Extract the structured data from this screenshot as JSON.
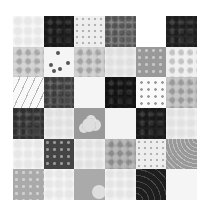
{
  "quilt": {
    "rows": 6,
    "columns": 6,
    "tiles": [
      {
        "row": 1,
        "col": 1,
        "color": "#f7f7f7",
        "pattern": "faint"
      },
      {
        "row": 1,
        "col": 2,
        "color": "#222222",
        "pattern": "mottle-dark"
      },
      {
        "row": 1,
        "col": 3,
        "color": "#eeeeee",
        "pattern": "dots"
      },
      {
        "row": 1,
        "col": 4,
        "color": "#777777",
        "pattern": "mottle-dark"
      },
      {
        "row": 1,
        "col": 5,
        "color": "#ffffff",
        "pattern": "none"
      },
      {
        "row": 1,
        "col": 6,
        "color": "#2a2a2a",
        "pattern": "mottle-dark"
      },
      {
        "row": 2,
        "col": 1,
        "color": "#cccccc",
        "pattern": "mottle"
      },
      {
        "row": 2,
        "col": 2,
        "color": "#f5f5f5",
        "pattern": "sprigs"
      },
      {
        "row": 2,
        "col": 3,
        "color": "#c8c8c8",
        "pattern": "mottle"
      },
      {
        "row": 2,
        "col": 4,
        "color": "#eeeeee",
        "pattern": "faint"
      },
      {
        "row": 2,
        "col": 5,
        "color": "#999999",
        "pattern": "dots-light"
      },
      {
        "row": 2,
        "col": 6,
        "color": "#eeeeee",
        "pattern": "mottle"
      },
      {
        "row": 3,
        "col": 1,
        "color": "#f8f8f8",
        "pattern": "lines"
      },
      {
        "row": 3,
        "col": 2,
        "color": "#555555",
        "pattern": "mottle-dark"
      },
      {
        "row": 3,
        "col": 3,
        "color": "#f5f5f5",
        "pattern": "none"
      },
      {
        "row": 3,
        "col": 4,
        "color": "#1a1a1a",
        "pattern": "mottle-dark"
      },
      {
        "row": 3,
        "col": 5,
        "color": "#fafafa",
        "pattern": "grid-dots"
      },
      {
        "row": 3,
        "col": 6,
        "color": "#bbbbbb",
        "pattern": "mottle"
      },
      {
        "row": 4,
        "col": 1,
        "color": "#444444",
        "pattern": "mottle-dark"
      },
      {
        "row": 4,
        "col": 2,
        "color": "#eeeeee",
        "pattern": "faint"
      },
      {
        "row": 4,
        "col": 3,
        "color": "#999999",
        "pattern": "flower"
      },
      {
        "row": 4,
        "col": 4,
        "color": "#f3f3f3",
        "pattern": "none"
      },
      {
        "row": 4,
        "col": 5,
        "color": "#222222",
        "pattern": "mottle-dark"
      },
      {
        "row": 4,
        "col": 6,
        "color": "#f0f0f0",
        "pattern": "faint"
      },
      {
        "row": 5,
        "col": 1,
        "color": "#f5f5f5",
        "pattern": "faint"
      },
      {
        "row": 5,
        "col": 2,
        "color": "#444444",
        "pattern": "dots-light"
      },
      {
        "row": 5,
        "col": 3,
        "color": "#f0f0f0",
        "pattern": "faint"
      },
      {
        "row": 5,
        "col": 4,
        "color": "#aaaaaa",
        "pattern": "mottle"
      },
      {
        "row": 5,
        "col": 5,
        "color": "#eeeeee",
        "pattern": "dots"
      },
      {
        "row": 5,
        "col": 6,
        "color": "#999999",
        "pattern": "waves"
      },
      {
        "row": 6,
        "col": 1,
        "color": "#aaaaaa",
        "pattern": "dots-light"
      },
      {
        "row": 6,
        "col": 2,
        "color": "#f5f5f5",
        "pattern": "faint"
      },
      {
        "row": 6,
        "col": 3,
        "color": "#aaaaaa",
        "pattern": "circle"
      },
      {
        "row": 6,
        "col": 4,
        "color": "#f3f3f3",
        "pattern": "faint"
      },
      {
        "row": 6,
        "col": 5,
        "color": "#1e1e1e",
        "pattern": "curves"
      },
      {
        "row": 6,
        "col": 6,
        "color": "#f5f5f5",
        "pattern": "none"
      }
    ]
  }
}
